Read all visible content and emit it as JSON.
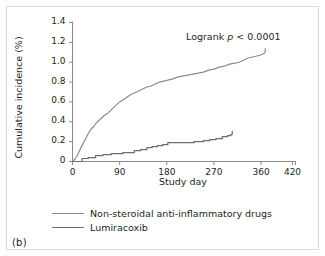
{
  "figure": {
    "panel_label": "(b)",
    "annotation_prefix": "Logrank ",
    "annotation_italic": "p",
    "annotation_suffix": " < 0.0001"
  },
  "chart_data": {
    "type": "line",
    "title": "",
    "xlabel": "Study day",
    "ylabel": "Cumulative incidence (%)",
    "xlim": [
      0,
      420
    ],
    "ylim": [
      0,
      1.4
    ],
    "xticks": [
      0,
      90,
      180,
      270,
      360,
      420
    ],
    "xtick_labels": [
      "0",
      "90",
      "180",
      "270",
      "360",
      "420"
    ],
    "yticks": [
      0,
      0.2,
      0.4,
      0.6,
      0.8,
      1.0,
      1.2,
      1.4
    ],
    "ytick_labels": [
      "0",
      "0.2",
      "0.4",
      "0.6",
      "0.8",
      "1.0",
      "1.2",
      "1.4"
    ],
    "grid": false,
    "legend_position": "below-axes",
    "annotations": [
      {
        "text": "Logrank p < 0.0001",
        "x": 300,
        "y": 1.25
      }
    ],
    "series": [
      {
        "name": "Non-steroidal anti-inflammatory drugs",
        "color": "#8c8c8c",
        "step": false,
        "x": [
          0,
          4,
          8,
          12,
          16,
          20,
          24,
          28,
          32,
          36,
          40,
          44,
          48,
          54,
          60,
          66,
          72,
          78,
          84,
          90,
          96,
          102,
          110,
          118,
          126,
          134,
          142,
          150,
          158,
          166,
          174,
          182,
          190,
          200,
          210,
          220,
          230,
          240,
          250,
          260,
          270,
          280,
          290,
          300,
          310,
          318,
          326,
          334,
          342,
          350,
          358,
          366,
          368
        ],
        "y": [
          0.0,
          0.02,
          0.05,
          0.09,
          0.14,
          0.18,
          0.22,
          0.26,
          0.3,
          0.33,
          0.35,
          0.38,
          0.4,
          0.43,
          0.46,
          0.48,
          0.51,
          0.54,
          0.57,
          0.6,
          0.62,
          0.64,
          0.67,
          0.69,
          0.71,
          0.73,
          0.75,
          0.76,
          0.78,
          0.8,
          0.81,
          0.82,
          0.83,
          0.85,
          0.86,
          0.87,
          0.88,
          0.89,
          0.9,
          0.92,
          0.93,
          0.95,
          0.96,
          0.98,
          0.99,
          1.0,
          1.02,
          1.04,
          1.05,
          1.06,
          1.07,
          1.09,
          1.1
        ]
      },
      {
        "name": "Lumiracoxib",
        "color": "#6e6e6e",
        "step": true,
        "x": [
          0,
          18,
          18,
          30,
          30,
          44,
          44,
          58,
          58,
          74,
          74,
          96,
          96,
          118,
          118,
          130,
          130,
          142,
          142,
          152,
          152,
          162,
          162,
          172,
          172,
          182,
          182,
          196,
          196,
          232,
          232,
          250,
          250,
          262,
          262,
          274,
          274,
          286,
          286,
          296,
          296,
          302,
          302,
          305
        ],
        "y": [
          0.0,
          0.0,
          0.03,
          0.03,
          0.04,
          0.04,
          0.06,
          0.06,
          0.07,
          0.07,
          0.08,
          0.08,
          0.09,
          0.09,
          0.11,
          0.11,
          0.12,
          0.12,
          0.14,
          0.14,
          0.15,
          0.15,
          0.16,
          0.16,
          0.17,
          0.17,
          0.19,
          0.19,
          0.19,
          0.19,
          0.2,
          0.2,
          0.21,
          0.21,
          0.22,
          0.22,
          0.23,
          0.23,
          0.25,
          0.25,
          0.26,
          0.26,
          0.27,
          0.27
        ]
      }
    ]
  },
  "legend": {
    "items": [
      {
        "label": "Non-steroidal anti-inflammatory drugs",
        "color": "#8c8c8c"
      },
      {
        "label": "Lumiracoxib",
        "color": "#6e6e6e"
      }
    ]
  },
  "colors": {
    "axis": "#8a8a8a",
    "text": "#231f20",
    "frame": "#d9d9d9"
  }
}
